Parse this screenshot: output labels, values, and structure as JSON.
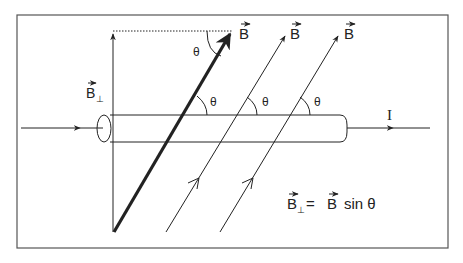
{
  "diagram": {
    "labels": {
      "b_vector": "B",
      "b_perp": "B",
      "perp_subscript": "⊥",
      "theta": "θ",
      "current": "I",
      "equation_lhs": "B",
      "equation_eq": "=",
      "equation_rhs_b": "B",
      "equation_rhs_sin": "sin θ"
    },
    "elements": [
      {
        "id": "wire",
        "kind": "cylinder",
        "label": "I"
      },
      {
        "id": "field-vector-main",
        "kind": "bold-arrow",
        "label": "B"
      },
      {
        "id": "field-line-2",
        "kind": "arrow",
        "label": "B"
      },
      {
        "id": "field-line-3",
        "kind": "arrow",
        "label": "B"
      },
      {
        "id": "perp-component",
        "kind": "arrow",
        "label": "B⊥"
      }
    ],
    "colors": {
      "stroke": "#222222",
      "background": "#ffffff",
      "frame": "#555555"
    }
  }
}
